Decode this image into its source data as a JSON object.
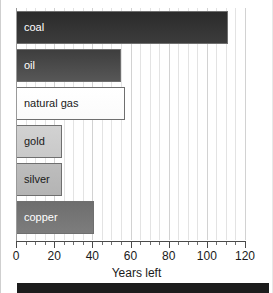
{
  "chart_data": {
    "type": "bar",
    "orientation": "horizontal",
    "title": "",
    "subtitle": "",
    "xlabel": "Years left",
    "ylabel": "",
    "xlim": [
      0,
      120
    ],
    "ylim": [],
    "grid": true,
    "legend": "none",
    "xticks": [
      0,
      20,
      40,
      60,
      80,
      100,
      120
    ],
    "xtick_labels": [
      "0",
      "20",
      "40",
      "60",
      "80",
      "100",
      "120"
    ],
    "minor_tick_step": 5,
    "categories": [
      "coal",
      "oil",
      "natural gas",
      "gold",
      "silver",
      "copper"
    ],
    "values": [
      111,
      55,
      57,
      24,
      24,
      41
    ],
    "bars": [
      {
        "label": "coal",
        "value": 111,
        "fill": "#2b2b2b",
        "fill_end": "#3c3c3c",
        "text_color": "#ffffff",
        "border": "#6f6f6f"
      },
      {
        "label": "oil",
        "value": 55,
        "fill": "#3e3e3e",
        "fill_end": "#575757",
        "text_color": "#ffffff",
        "border": "#6f6f6f"
      },
      {
        "label": "natural gas",
        "value": 57,
        "fill": "#ffffff",
        "fill_end": "#fbfbfb",
        "text_color": "#1a1a1a",
        "border": "#6f6f6f"
      },
      {
        "label": "gold",
        "value": 24,
        "fill": "#d2d2d2",
        "fill_end": "#c9c9c9",
        "text_color": "#1a1a1a",
        "border": "#6f6f6f"
      },
      {
        "label": "silver",
        "value": 24,
        "fill": "#bdbdbd",
        "fill_end": "#b4b4b4",
        "text_color": "#1a1a1a",
        "border": "#6f6f6f"
      },
      {
        "label": "copper",
        "value": 41,
        "fill": "#6e6e6e",
        "fill_end": "#7d7d7d",
        "text_color": "#ffffff",
        "border": "#6f6f6f"
      }
    ]
  },
  "colors": {
    "background": "#ffffff",
    "gridline": "#e3e3e3",
    "gridline_major": "#d2d2d2",
    "axis": "#4a4a4a",
    "axis_left": "#9a9a9a",
    "tick_text": "#1a1a1a",
    "bottom_band": "#1c1c1c"
  }
}
